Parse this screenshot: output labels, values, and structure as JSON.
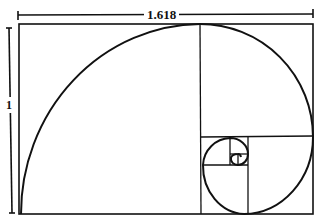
{
  "diagram": {
    "width_label": "1.618",
    "height_label": "1",
    "stroke_color": "#111111",
    "background": "#ffffff",
    "elements": [
      "outer golden rectangle",
      "nested squares",
      "quarter-circle arc spiral",
      "width dimension line",
      "height dimension line"
    ]
  }
}
